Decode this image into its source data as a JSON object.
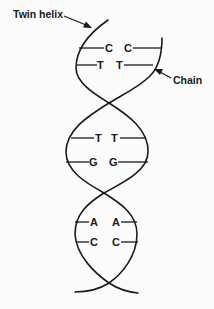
{
  "diagram": {
    "labels": {
      "twin_helix": "Twin helix",
      "chain": "Chain"
    },
    "base_pairs": [
      {
        "left": "C",
        "right": "C",
        "section": "top"
      },
      {
        "left": "T",
        "right": "T",
        "section": "top"
      },
      {
        "left": "T",
        "right": "T",
        "section": "middle"
      },
      {
        "left": "G",
        "right": "G",
        "section": "middle"
      },
      {
        "left": "A",
        "right": "A",
        "section": "bottom"
      },
      {
        "left": "C",
        "right": "C",
        "section": "bottom"
      }
    ],
    "colors": {
      "ink": "#1a1a1a",
      "background": "#fbfbfb"
    }
  }
}
